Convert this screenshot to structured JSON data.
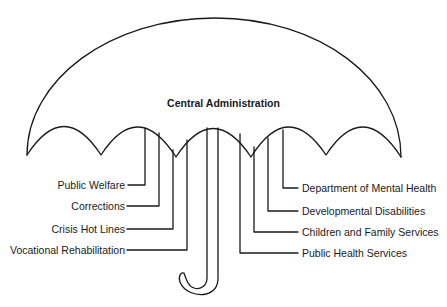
{
  "diagram": {
    "type": "umbrella-organization-chart",
    "center_label": "Central Administration",
    "stroke_color": "#1a1a1a",
    "left_branches": [
      {
        "label": "Public Welfare"
      },
      {
        "label": "Corrections"
      },
      {
        "label": "Crisis Hot Lines"
      },
      {
        "label": "Vocational Rehabilitation"
      }
    ],
    "right_branches": [
      {
        "label": "Department of Mental Health"
      },
      {
        "label": "Developmental Disabilities"
      },
      {
        "label": "Children and Family Services"
      },
      {
        "label": "Public Health Services"
      }
    ]
  }
}
